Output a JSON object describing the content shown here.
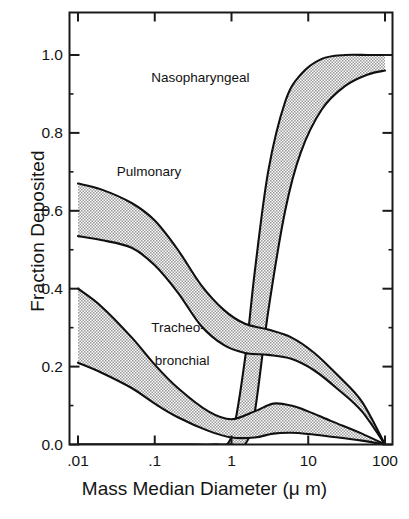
{
  "figure": {
    "xlabel": "Mass Median Diameter (μ m)",
    "ylabel": "Fraction Deposited"
  },
  "chart_data": {
    "type": "area",
    "title": "",
    "xlabel": "Mass Median Diameter (μ m)",
    "ylabel": "Fraction Deposited",
    "xscale": "log",
    "xlim": [
      0.01,
      100
    ],
    "ylim": [
      0.0,
      1.0
    ],
    "xtick_labels": [
      ".01",
      ".1",
      "1",
      "10",
      "100"
    ],
    "xtick_values": [
      0.01,
      0.1,
      1,
      10,
      100
    ],
    "ytick_labels": [
      "0.0",
      "0.2",
      "0.4",
      "0.6",
      "0.8",
      "1.0"
    ],
    "ytick_values": [
      0.0,
      0.2,
      0.4,
      0.6,
      0.8,
      1.0
    ],
    "grid": false,
    "legend": "inline-annotations",
    "annotations": [
      {
        "text": "Nasopharyngeal",
        "x": 0.09,
        "y": 0.94
      },
      {
        "text": "Pulmonary",
        "x": 0.032,
        "y": 0.7
      },
      {
        "text": "Tracheo-",
        "x": 0.09,
        "y": 0.3
      },
      {
        "text": "bronchial",
        "x": 0.1,
        "y": 0.215
      }
    ],
    "series": [
      {
        "name": "Nasopharyngeal",
        "band": true,
        "x": [
          0.01,
          0.1,
          0.3,
          0.6,
          1.0,
          1.5,
          2.0,
          3.0,
          5.0,
          8.0,
          15.0,
          30.0,
          60.0,
          100.0
        ],
        "upper": [
          0.0,
          0.0,
          0.0,
          0.0,
          0.02,
          0.22,
          0.44,
          0.7,
          0.88,
          0.95,
          0.99,
          1.0,
          1.0,
          1.0
        ],
        "lower": [
          0.0,
          0.0,
          0.0,
          0.0,
          0.0,
          0.0,
          0.08,
          0.34,
          0.6,
          0.75,
          0.86,
          0.92,
          0.95,
          0.96
        ]
      },
      {
        "name": "Pulmonary",
        "band": true,
        "x": [
          0.01,
          0.02,
          0.05,
          0.1,
          0.2,
          0.4,
          0.8,
          1.5,
          3.0,
          6.0,
          12.0,
          25.0,
          50.0,
          100.0
        ],
        "upper": [
          0.67,
          0.655,
          0.62,
          0.575,
          0.5,
          0.41,
          0.345,
          0.31,
          0.295,
          0.275,
          0.235,
          0.175,
          0.11,
          0.0
        ],
        "lower": [
          0.535,
          0.525,
          0.505,
          0.46,
          0.39,
          0.305,
          0.255,
          0.235,
          0.23,
          0.22,
          0.19,
          0.14,
          0.085,
          0.0
        ]
      },
      {
        "name": "Tracheobronchial",
        "band": true,
        "x": [
          0.01,
          0.02,
          0.05,
          0.1,
          0.2,
          0.5,
          1.0,
          2.0,
          3.5,
          6.0,
          10.0,
          20.0,
          50.0,
          100.0
        ],
        "upper": [
          0.4,
          0.355,
          0.275,
          0.205,
          0.145,
          0.085,
          0.065,
          0.085,
          0.105,
          0.1,
          0.085,
          0.06,
          0.028,
          0.0
        ],
        "lower": [
          0.21,
          0.185,
          0.145,
          0.105,
          0.07,
          0.035,
          0.018,
          0.018,
          0.028,
          0.03,
          0.027,
          0.02,
          0.01,
          0.0
        ]
      }
    ]
  },
  "colors": {
    "axis": "#1a1a1a",
    "band_fill": "#b6b6b6",
    "band_edge": "#101010",
    "text": "#141414",
    "background": "#ffffff"
  }
}
